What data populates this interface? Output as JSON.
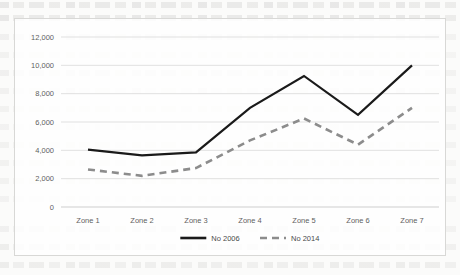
{
  "chart_data": {
    "type": "line",
    "title": "",
    "xlabel": "",
    "ylabel": "",
    "categories": [
      "Zone 1",
      "Zone 2",
      "Zone 3",
      "Zone 4",
      "Zone 5",
      "Zone 6",
      "Zone 7"
    ],
    "series": [
      {
        "name": "No 2006",
        "style": "solid",
        "color": "#1a1a1a",
        "values": [
          4050,
          3650,
          3850,
          7000,
          9250,
          6500,
          10000
        ]
      },
      {
        "name": "No 2014",
        "style": "dashed",
        "color": "#8c8c8c",
        "values": [
          2650,
          2200,
          2750,
          4700,
          6250,
          4400,
          7000
        ]
      }
    ],
    "ylim": [
      0,
      12000
    ],
    "yticks": [
      0,
      2000,
      4000,
      6000,
      8000,
      10000,
      12000
    ],
    "ytick_labels": [
      "0",
      "2,000",
      "4,000",
      "6,000",
      "8,000",
      "10,000",
      "12,000"
    ],
    "grid": true,
    "legend_position": "bottom"
  },
  "legend": {
    "entries": [
      {
        "label": "No 2006",
        "swatch": "solid-line-swatch"
      },
      {
        "label": "No 2014",
        "swatch": "dashed-line-swatch"
      }
    ]
  },
  "colors": {
    "series_2006": "#1a1a1a",
    "series_2014": "#8c8c8c",
    "gridline": "#d9d9d9",
    "frame": "#d8d8d6",
    "tick_text": "#5f5f5f"
  }
}
